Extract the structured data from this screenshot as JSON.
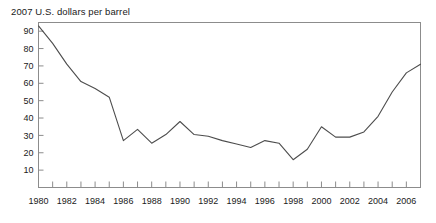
{
  "chart_data": {
    "type": "line",
    "title": "2007 U.S. dollars per barrel",
    "xlabel": "",
    "ylabel": "",
    "xlim": [
      1980,
      2007
    ],
    "ylim": [
      0,
      95
    ],
    "grid": false,
    "legend": "none",
    "line_color": "#4d4d4d",
    "axis_color": "#808080",
    "background": "#ffffff",
    "y_ticks": [
      10,
      20,
      30,
      40,
      50,
      60,
      70,
      80,
      90
    ],
    "y_tick_labels": [
      "10",
      "20",
      "30",
      "40",
      "50",
      "60",
      "70",
      "80",
      "90"
    ],
    "x_ticks": [
      1980,
      1981,
      1982,
      1983,
      1984,
      1985,
      1986,
      1987,
      1988,
      1989,
      1990,
      1991,
      1992,
      1993,
      1994,
      1995,
      1996,
      1997,
      1998,
      1999,
      2000,
      2001,
      2002,
      2003,
      2004,
      2005,
      2006,
      2007
    ],
    "x_tick_labels_shown": [
      "1980",
      "1982",
      "1984",
      "1986",
      "1988",
      "1990",
      "1992",
      "1994",
      "1996",
      "1998",
      "2000",
      "2002",
      "2004",
      "2006"
    ],
    "x": [
      1980,
      1981,
      1982,
      1983,
      1984,
      1985,
      1986,
      1987,
      1988,
      1989,
      1990,
      1991,
      1992,
      1993,
      1994,
      1995,
      1996,
      1997,
      1998,
      1999,
      2000,
      2001,
      2002,
      2003,
      2004,
      2005,
      2006,
      2007
    ],
    "values": [
      93,
      83,
      71,
      61,
      57,
      52,
      27,
      33.5,
      25.5,
      30.5,
      38,
      30.5,
      29.5,
      27,
      25,
      23,
      27,
      25.5,
      16,
      22,
      35,
      29,
      29,
      32,
      41,
      55,
      66,
      71
    ],
    "series": [
      {
        "name": "Crude oil price",
        "values": [
          93,
          83,
          71,
          61,
          57,
          52,
          27,
          33.5,
          25.5,
          30.5,
          38,
          30.5,
          29.5,
          27,
          25,
          23,
          27,
          25.5,
          16,
          22,
          35,
          29,
          29,
          32,
          41,
          55,
          66,
          71
        ]
      }
    ]
  }
}
